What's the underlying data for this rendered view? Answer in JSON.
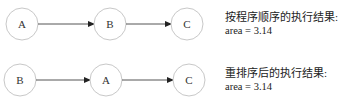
{
  "rows": [
    {
      "nodes": [
        "A",
        "B",
        "C"
      ],
      "caption_title": "按程序顺序的执行结果:",
      "caption_value": "area = 3.14"
    },
    {
      "nodes": [
        "B",
        "A",
        "C"
      ],
      "caption_title": "重排序后的执行结果:",
      "caption_value": "area = 3.14"
    }
  ],
  "colors": {
    "node_stroke": "#c8c8c8",
    "edge": "#555555",
    "text": "#222222"
  }
}
